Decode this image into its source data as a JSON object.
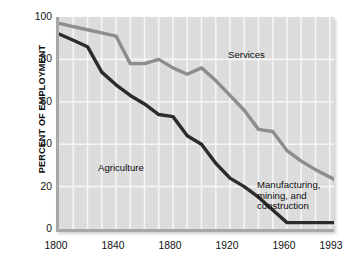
{
  "chart_data": {
    "type": "line",
    "title": "",
    "xlabel": "",
    "ylabel": "PERCENT OF EMPLOYMENT",
    "xlim": [
      1800,
      1993
    ],
    "ylim": [
      0,
      100
    ],
    "grid": true,
    "grid_x_step": 10,
    "grid_y_step": 20,
    "legend_position": "inline-annotations",
    "xticks": [
      1800,
      1840,
      1880,
      1920,
      1960,
      1993
    ],
    "xtick_labels": [
      "1800",
      "1840",
      "1880",
      "1920",
      "1960",
      "1993"
    ],
    "yticks": [
      0,
      20,
      40,
      60,
      80,
      100
    ],
    "ytick_labels": [
      "0",
      "20",
      "40",
      "60",
      "80",
      "100"
    ],
    "series": [
      {
        "name": "Services",
        "color": "#8d8d8d",
        "x": [
          1800,
          1810,
          1820,
          1830,
          1840,
          1850,
          1860,
          1870,
          1880,
          1890,
          1900,
          1910,
          1920,
          1930,
          1940,
          1950,
          1960,
          1970,
          1980,
          1993
        ],
        "values": [
          97,
          95.5,
          94,
          92.5,
          91,
          78,
          78,
          80,
          76,
          73,
          76,
          70,
          63,
          56,
          47,
          46,
          37,
          32,
          28,
          23.5
        ]
      },
      {
        "name": "Agriculture",
        "color": "#2b2b2b",
        "x": [
          1800,
          1810,
          1820,
          1830,
          1840,
          1850,
          1860,
          1870,
          1880,
          1890,
          1900,
          1910,
          1920,
          1930,
          1940,
          1950,
          1960,
          1970,
          1980,
          1993
        ],
        "values": [
          92,
          89,
          86,
          74,
          68,
          63,
          59,
          54,
          53,
          44,
          40,
          31,
          24,
          20,
          15,
          9,
          3,
          3,
          3,
          3
        ]
      }
    ],
    "annotations": [
      {
        "name": "services-label",
        "text": "Services",
        "x": 1935,
        "y": 84
      },
      {
        "name": "agriculture-label",
        "text": "Agriculture",
        "x": 1838,
        "y": 31
      },
      {
        "name": "manufacturing-label",
        "lines": [
          "Manufacturing,",
          "mining, and",
          "construction"
        ],
        "x": 1954,
        "y": 22
      }
    ]
  },
  "labels": {
    "y_axis_title": "PERCENT OF EMPLOYMENT",
    "annotation_services": "Services",
    "annotation_agriculture": "Agriculture",
    "annotation_mmc_line1": "Manufacturing,",
    "annotation_mmc_line2": "mining, and",
    "annotation_mmc_line3": "construction"
  },
  "colors": {
    "plot_background": "#dcdcdc",
    "gridline": "#f5f5f5",
    "frame": "#a8a8a8",
    "series_services": "#8d8d8d",
    "series_agriculture": "#2b2b2b",
    "text": "#101010",
    "page_background": "#ffffff"
  }
}
